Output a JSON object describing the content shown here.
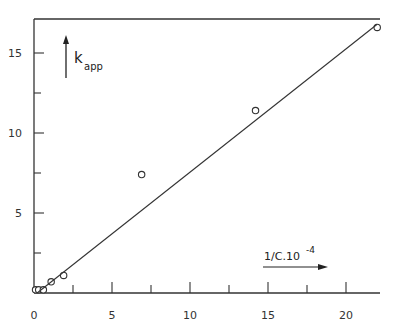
{
  "chart_data": {
    "type": "scatter",
    "title": "",
    "xlabel": "1/C.10^-4",
    "xlabel_main": "1/C.10",
    "xlabel_exp": "-4",
    "ylabel": "k_app",
    "ylabel_main": "k",
    "ylabel_sub": "app",
    "xlim": [
      0,
      22
    ],
    "ylim": [
      0,
      17
    ],
    "x_ticks": [
      0,
      5,
      10,
      15,
      20
    ],
    "y_ticks": [
      5,
      10,
      15
    ],
    "x_tick_labels": [
      "0",
      "5",
      "10",
      "15",
      "20"
    ],
    "y_tick_labels": [
      "5",
      "10",
      "15"
    ],
    "grid": false,
    "series": [
      {
        "name": "measured",
        "marker": "open-circle",
        "x": [
          0.1,
          0.3,
          0.6,
          1.1,
          1.9,
          6.9,
          14.2,
          22.0
        ],
        "y": [
          0.2,
          0.2,
          0.2,
          0.7,
          1.1,
          7.4,
          11.4,
          16.6
        ]
      },
      {
        "name": "linear fit",
        "marker": "line",
        "x": [
          0.2,
          22.0
        ],
        "y": [
          0.0,
          16.8
        ]
      }
    ]
  },
  "colors": {
    "ink": "#333333",
    "background": "#ffffff"
  }
}
